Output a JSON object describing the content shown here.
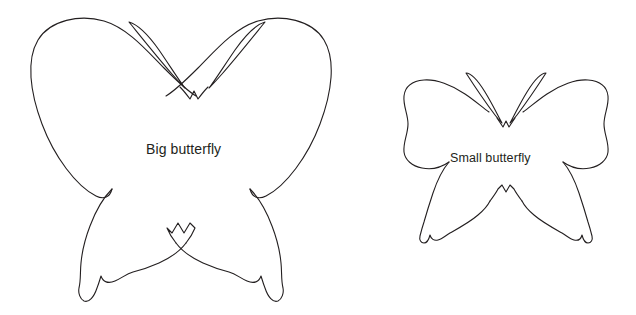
{
  "page": {
    "background_color": "#ffffff",
    "outline_color": "#231f20",
    "text_color": "#231f20"
  },
  "shapes": [
    {
      "name": "big-butterfly",
      "label": "Big butterfly",
      "kind": "butterfly-outline",
      "bounds": {
        "x": 28,
        "y": 18,
        "width": 336,
        "height": 288
      },
      "stroke_width": 1.1
    },
    {
      "name": "small-butterfly",
      "label": "Small butterfly",
      "kind": "butterfly-outline",
      "bounds": {
        "x": 403,
        "y": 70,
        "width": 203,
        "height": 178
      },
      "stroke_width": 1.1
    }
  ],
  "labels": {
    "big": "Big butterfly",
    "small": "Small butterfly"
  }
}
